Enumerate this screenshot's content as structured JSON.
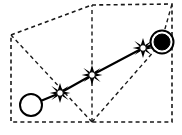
{
  "figure": {
    "type": "diagram",
    "width": 182,
    "height": 135,
    "background_color": "#ffffff",
    "stroke_color": "#000000",
    "dashed_color": "#1a1a1a"
  },
  "boundary": {
    "name": "workspace-boundary",
    "style": "dashed",
    "points": [
      [
        11,
        35
      ],
      [
        92,
        5
      ],
      [
        172,
        4
      ],
      [
        172,
        122
      ],
      [
        92,
        122
      ],
      [
        11,
        122
      ]
    ]
  },
  "guides": {
    "name": "visibility-guides",
    "style": "dashed",
    "apex": [
      92,
      122
    ],
    "segments": [
      {
        "name": "guide-apex-to-left-corner",
        "from": [
          92,
          122
        ],
        "to": [
          11,
          35
        ]
      },
      {
        "name": "guide-apex-to-top-vertex",
        "from": [
          92,
          122
        ],
        "to": [
          92,
          5
        ]
      },
      {
        "name": "guide-apex-to-goal",
        "from": [
          92,
          122
        ],
        "to": [
          162,
          42
        ]
      },
      {
        "name": "guide-goal-to-top-right",
        "from": [
          162,
          42
        ],
        "to": [
          172,
          4
        ]
      }
    ]
  },
  "path": {
    "name": "solution-path",
    "style": "solid",
    "waypoints": [
      {
        "label": "start",
        "x": 31,
        "y": 105,
        "marker": "open-circle",
        "radius": 11
      },
      {
        "label": "node-1",
        "x": 60,
        "y": 93,
        "marker": "star"
      },
      {
        "label": "node-2",
        "x": 92,
        "y": 75,
        "marker": "star"
      },
      {
        "label": "node-3",
        "x": 143,
        "y": 48,
        "marker": "star"
      },
      {
        "label": "goal",
        "x": 162,
        "y": 42,
        "marker": "filled-circle-ring",
        "radius": 11
      }
    ]
  },
  "legend": {
    "start_label": "",
    "goal_label": "",
    "node_label": ""
  }
}
